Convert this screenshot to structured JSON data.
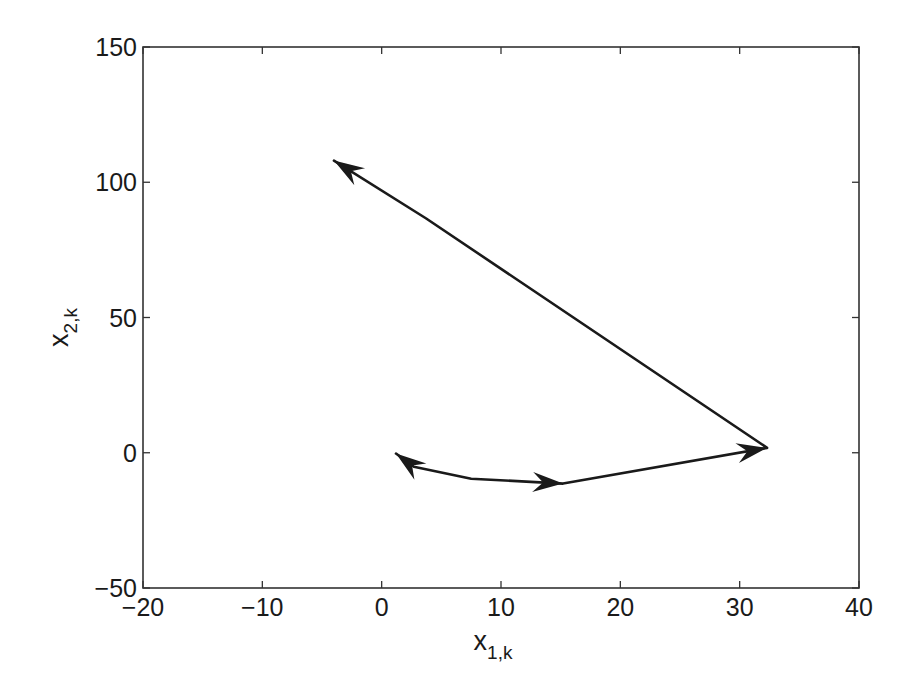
{
  "chart_data": {
    "type": "line",
    "title": "",
    "xlabel": "x",
    "xlabel_sub": "1,k",
    "ylabel": "x",
    "ylabel_sub": "2,k",
    "xlim": [
      -20,
      40
    ],
    "ylim": [
      -50,
      150
    ],
    "xticks": [
      -20,
      -10,
      0,
      10,
      20,
      30,
      40
    ],
    "yticks": [
      -50,
      0,
      50,
      100,
      150
    ],
    "xtick_labels": [
      "−20",
      "−10",
      "0",
      "10",
      "20",
      "30",
      "40"
    ],
    "ytick_labels": [
      "−50",
      "0",
      "50",
      "100",
      "150"
    ],
    "grid": false,
    "legend": null,
    "series": [
      {
        "name": "trajectory",
        "color": "#1a1a1a",
        "x": [
          1.2,
          2.7,
          7.5,
          15.2,
          32.3,
          3.7,
          -4.0
        ],
        "y": [
          -0.3,
          -5.2,
          -9.6,
          -11.4,
          1.8,
          86.7,
          108.0
        ]
      }
    ],
    "arrows": [
      {
        "at": [
          1.2,
          -0.3
        ],
        "from": [
          2.7,
          -5.2
        ]
      },
      {
        "at": [
          15.2,
          -11.4
        ],
        "from": [
          7.5,
          -9.6
        ]
      },
      {
        "at": [
          32.3,
          1.8
        ],
        "from": [
          15.2,
          -11.4
        ]
      },
      {
        "at": [
          -4.0,
          108.0
        ],
        "from": [
          3.7,
          86.7
        ]
      }
    ]
  },
  "layout": {
    "plot_left": 143,
    "plot_right": 859,
    "plot_top": 47,
    "plot_bottom": 588
  }
}
